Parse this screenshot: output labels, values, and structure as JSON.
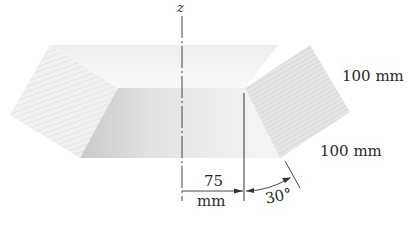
{
  "diagram": {
    "type": "engineering-drawing",
    "axis": {
      "label": "z",
      "style": "dash-dot centerline"
    },
    "dimensions": {
      "radial_offset": {
        "value": "75",
        "unit": "mm"
      },
      "upper_edge": "100 mm",
      "lower_edge": "100 mm",
      "angle": "30°"
    },
    "colors": {
      "ink": "#2a2a2a",
      "shade_light": "#ececec",
      "shade_mid": "#dcdcdc",
      "shade_dark": "#cfcfcf",
      "background": "#ffffff"
    }
  }
}
